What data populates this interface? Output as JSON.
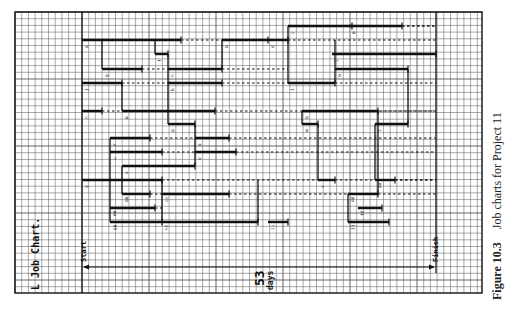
{
  "caption": {
    "figure_label": "Figure 10.3",
    "title": "Job charts for Project 11"
  },
  "chart_title": "L Job Chart.",
  "start_label": "Start",
  "finish_label": "Finish",
  "duration": {
    "value": "53",
    "unit": "days"
  },
  "colors": {
    "ink": "#111111",
    "grid": "#555555",
    "paper": "#ffffff"
  },
  "chart_data": {
    "type": "table",
    "title": "L Job Chart",
    "total_duration_days": 53,
    "grid": {
      "x0": 15,
      "y0": 12,
      "x1": 482,
      "y1": 293,
      "cell": 6.7,
      "start_x": 82,
      "finish_x": 436
    },
    "bars": [
      {
        "y": 40,
        "x1": 82,
        "x2": 181,
        "float_to": 222,
        "label": "a"
      },
      {
        "y": 40,
        "x1": 222,
        "x2": 268,
        "float_to": 288,
        "label": "b"
      },
      {
        "y": 26,
        "x1": 288,
        "x2": 352,
        "float_to": 436,
        "label": "c"
      },
      {
        "y": 40,
        "x1": 288,
        "x2": 268,
        "float_to": 436,
        "label": "d"
      },
      {
        "y": 26,
        "x1": 349,
        "x2": 402,
        "float_to": 436,
        "label": "e"
      },
      {
        "y": 54,
        "x1": 155,
        "x2": 168,
        "float_to": 168,
        "label": "f"
      },
      {
        "y": 69,
        "x1": 102,
        "x2": 142,
        "float_to": 168,
        "label": "g"
      },
      {
        "y": 69,
        "x1": 168,
        "x2": 222,
        "float_to": 288,
        "label": "h"
      },
      {
        "y": 54,
        "x1": 332,
        "x2": 436,
        "float_to": 436,
        "label": "i"
      },
      {
        "y": 83,
        "x1": 82,
        "x2": 122,
        "float_to": 168,
        "label": "j"
      },
      {
        "y": 83,
        "x1": 168,
        "x2": 222,
        "float_to": 288,
        "label": "k"
      },
      {
        "y": 83,
        "x1": 288,
        "x2": 335,
        "float_to": 436,
        "label": "l"
      },
      {
        "y": 69,
        "x1": 335,
        "x2": 408,
        "float_to": 408,
        "label": "m"
      },
      {
        "y": 111,
        "x1": 82,
        "x2": 102,
        "float_to": 122,
        "label": "n"
      },
      {
        "y": 111,
        "x1": 122,
        "x2": 215,
        "float_to": 436,
        "label": "o"
      },
      {
        "y": 124,
        "x1": 168,
        "x2": 195,
        "float_to": 195,
        "label": "p"
      },
      {
        "y": 111,
        "x1": 302,
        "x2": 378,
        "float_to": 436,
        "label": "q"
      },
      {
        "y": 138,
        "x1": 110,
        "x2": 150,
        "float_to": 195,
        "label": "r"
      },
      {
        "y": 138,
        "x1": 195,
        "x2": 229,
        "float_to": 436,
        "label": "s"
      },
      {
        "y": 124,
        "x1": 375,
        "x2": 408,
        "float_to": 408,
        "label": "t"
      },
      {
        "y": 152,
        "x1": 110,
        "x2": 162,
        "float_to": 195,
        "label": "u"
      },
      {
        "y": 152,
        "x1": 195,
        "x2": 236,
        "float_to": 436,
        "label": "v"
      },
      {
        "y": 124,
        "x1": 302,
        "x2": 318,
        "float_to": 318,
        "label": "w"
      },
      {
        "y": 166,
        "x1": 122,
        "x2": 195,
        "float_to": 195,
        "label": "x"
      },
      {
        "y": 180,
        "x1": 82,
        "x2": 162,
        "float_to": 318,
        "label": "y"
      },
      {
        "y": 180,
        "x1": 318,
        "x2": 335,
        "float_to": 436,
        "label": "z"
      },
      {
        "y": 180,
        "x1": 375,
        "x2": 395,
        "float_to": 436,
        "label": "aa"
      },
      {
        "y": 194,
        "x1": 122,
        "x2": 150,
        "float_to": 162,
        "label": "bb"
      },
      {
        "y": 194,
        "x1": 162,
        "x2": 229,
        "float_to": 348,
        "label": "cc"
      },
      {
        "y": 194,
        "x1": 348,
        "x2": 378,
        "float_to": 436,
        "label": "dd"
      },
      {
        "y": 208,
        "x1": 110,
        "x2": 155,
        "float_to": 162,
        "label": "ee"
      },
      {
        "y": 208,
        "x1": 358,
        "x2": 382,
        "float_to": 382,
        "label": "ff"
      },
      {
        "y": 222,
        "x1": 110,
        "x2": 162,
        "float_to": 162,
        "label": "gg"
      },
      {
        "y": 222,
        "x1": 162,
        "x2": 258,
        "float_to": 258,
        "label": "hh"
      },
      {
        "y": 222,
        "x1": 268,
        "x2": 288,
        "float_to": 288,
        "label": "ii"
      },
      {
        "y": 222,
        "x1": 348,
        "x2": 389,
        "float_to": 389,
        "label": "jj"
      }
    ],
    "dependency_lines": [
      {
        "x": 102,
        "y1": 40,
        "y2": 69
      },
      {
        "x": 168,
        "y1": 54,
        "y2": 124
      },
      {
        "x": 155,
        "y1": 40,
        "y2": 54
      },
      {
        "x": 222,
        "y1": 40,
        "y2": 69
      },
      {
        "x": 288,
        "y1": 26,
        "y2": 83
      },
      {
        "x": 335,
        "y1": 40,
        "y2": 83
      },
      {
        "x": 122,
        "y1": 83,
        "y2": 111
      },
      {
        "x": 110,
        "y1": 138,
        "y2": 222
      },
      {
        "x": 122,
        "y1": 166,
        "y2": 194
      },
      {
        "x": 195,
        "y1": 124,
        "y2": 166
      },
      {
        "x": 162,
        "y1": 180,
        "y2": 222
      },
      {
        "x": 302,
        "y1": 111,
        "y2": 124
      },
      {
        "x": 318,
        "y1": 124,
        "y2": 180
      },
      {
        "x": 375,
        "y1": 124,
        "y2": 180
      },
      {
        "x": 408,
        "y1": 69,
        "y2": 124
      },
      {
        "x": 348,
        "y1": 194,
        "y2": 222
      },
      {
        "x": 258,
        "y1": 180,
        "y2": 222
      },
      {
        "x": 378,
        "y1": 111,
        "y2": 194
      },
      {
        "x": 436,
        "y1": 12,
        "y2": 260
      }
    ],
    "duration_arrow": {
      "y": 267,
      "x1": 82,
      "x2": 436,
      "label": "53 days"
    },
    "annotations": [
      "Start",
      "Finish",
      "53 days",
      "L Job Chart."
    ]
  }
}
